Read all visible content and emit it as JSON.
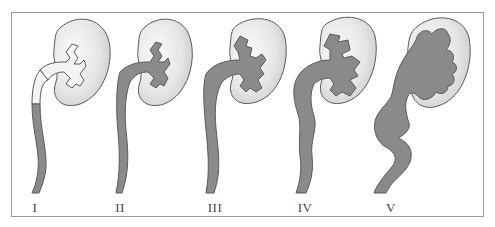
{
  "figure": {
    "colors": {
      "kidney_fill_light": "#f2f2f2",
      "kidney_fill_dark": "#cfcfcf",
      "reflux_fill": "#8a8a8a",
      "outline": "#5a5a5a",
      "frame": "#9a9a9a",
      "label": "#444444"
    },
    "grades": [
      {
        "label": "I",
        "x": 35
      },
      {
        "label": "II",
        "x": 120
      },
      {
        "label": "III",
        "x": 215
      },
      {
        "label": "IV",
        "x": 305
      },
      {
        "label": "V",
        "x": 391
      }
    ]
  }
}
